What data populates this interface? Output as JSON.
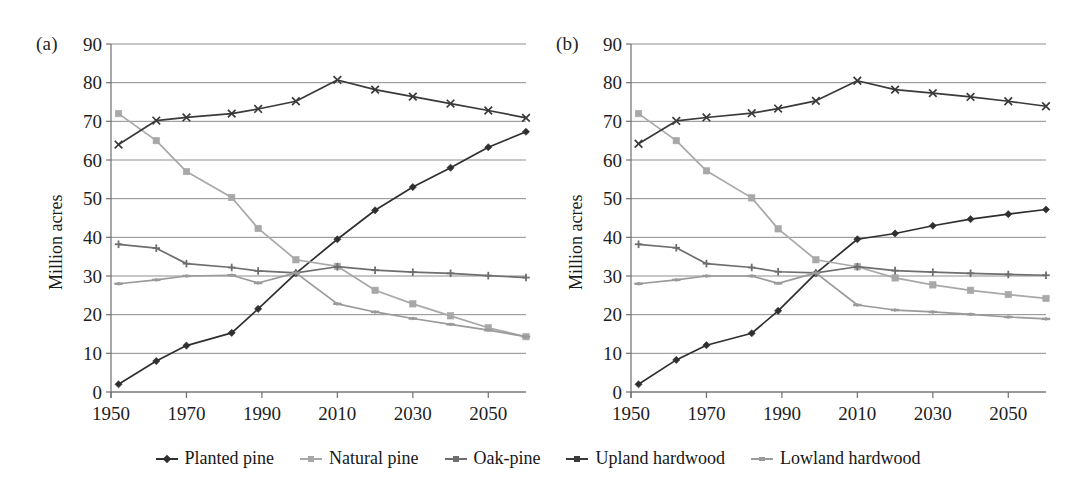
{
  "figure": {
    "background": "#ffffff",
    "panels": [
      {
        "letter": "(a)",
        "ylabel": "Million acres"
      },
      {
        "letter": "(b)",
        "ylabel": "Million acres"
      }
    ]
  },
  "legend": {
    "position": "bottom-center",
    "items": [
      {
        "label": "Planted pine",
        "color": "#2f2f2f",
        "marker": "diamond"
      },
      {
        "label": "Natural pine",
        "color": "#a8a8a8",
        "marker": "square"
      },
      {
        "label": "Oak-pine",
        "color": "#6e6e6e",
        "marker": "plus"
      },
      {
        "label": "Upland hardwood",
        "color": "#3a3a3a",
        "marker": "cross"
      },
      {
        "label": "Lowland hardwood",
        "color": "#9a9a9a",
        "marker": "dash"
      }
    ]
  },
  "chart_data": [
    {
      "type": "line",
      "panel": "(a)",
      "title": "",
      "xlabel": "",
      "ylabel": "Million acres",
      "grid": true,
      "legend_position": "below-figure",
      "x": [
        1952,
        1962,
        1970,
        1982,
        1989,
        1999,
        2010,
        2020,
        2030,
        2040,
        2050,
        2060
      ],
      "xlim": [
        1950,
        2060
      ],
      "ylim": [
        0,
        90
      ],
      "xticks": [
        1950,
        1970,
        1990,
        2010,
        2030,
        2050
      ],
      "xticklabels": [
        "1950",
        "1970",
        "1990",
        "2010",
        "2030",
        "2050"
      ],
      "yticks": [
        0,
        10,
        20,
        30,
        40,
        50,
        60,
        70,
        80,
        90
      ],
      "yticklabels": [
        "0",
        "10",
        "20",
        "30",
        "40",
        "50",
        "60",
        "70",
        "80",
        "90"
      ],
      "series": [
        {
          "name": "Planted pine",
          "color": "#2f2f2f",
          "marker": "diamond",
          "values": [
            2,
            8,
            12,
            15.3,
            21.5,
            30.7,
            39.5,
            47,
            53,
            58,
            63.3,
            67.3
          ]
        },
        {
          "name": "Natural pine",
          "color": "#a8a8a8",
          "marker": "square",
          "values": [
            72,
            65,
            57,
            50.3,
            42.3,
            34.2,
            32.5,
            26.3,
            22.8,
            19.7,
            16.6,
            14.3
          ]
        },
        {
          "name": "Oak-pine",
          "color": "#6e6e6e",
          "marker": "plus",
          "values": [
            38.2,
            37.2,
            33.2,
            32.2,
            31.3,
            30.8,
            32.4,
            31.5,
            31,
            30.7,
            30.1,
            29.6
          ]
        },
        {
          "name": "Upland hardwood",
          "color": "#3a3a3a",
          "marker": "cross",
          "values": [
            64,
            70.2,
            71,
            72,
            73.2,
            75.2,
            80.7,
            78.2,
            76.4,
            74.6,
            72.8,
            70.9
          ]
        },
        {
          "name": "Lowland hardwood",
          "color": "#9a9a9a",
          "marker": "dash",
          "values": [
            28,
            29,
            30,
            30.2,
            28.2,
            30.8,
            22.8,
            20.7,
            19,
            17.5,
            16,
            14.3
          ]
        }
      ]
    },
    {
      "type": "line",
      "panel": "(b)",
      "title": "",
      "xlabel": "",
      "ylabel": "Million acres",
      "grid": true,
      "legend_position": "below-figure",
      "x": [
        1952,
        1962,
        1970,
        1982,
        1989,
        1999,
        2010,
        2020,
        2030,
        2040,
        2050,
        2060
      ],
      "xlim": [
        1950,
        2060
      ],
      "ylim": [
        0,
        90
      ],
      "xticks": [
        1950,
        1970,
        1990,
        2010,
        2030,
        2050
      ],
      "xticklabels": [
        "1950",
        "1970",
        "1990",
        "2010",
        "2030",
        "2050"
      ],
      "yticks": [
        0,
        10,
        20,
        30,
        40,
        50,
        60,
        70,
        80,
        90
      ],
      "yticklabels": [
        "0",
        "10",
        "20",
        "30",
        "40",
        "50",
        "60",
        "70",
        "80",
        "90"
      ],
      "series": [
        {
          "name": "Planted pine",
          "color": "#2f2f2f",
          "marker": "diamond",
          "values": [
            2,
            8.3,
            12.1,
            15.2,
            21,
            30.7,
            39.5,
            41,
            43,
            44.7,
            46,
            47.2
          ]
        },
        {
          "name": "Natural pine",
          "color": "#a8a8a8",
          "marker": "square",
          "values": [
            72,
            65,
            57.2,
            50.2,
            42.2,
            34.2,
            32.4,
            29.5,
            27.7,
            26.3,
            25.2,
            24.2
          ]
        },
        {
          "name": "Oak-pine",
          "color": "#6e6e6e",
          "marker": "plus",
          "values": [
            38.2,
            37.3,
            33.2,
            32.2,
            31.1,
            30.8,
            32.4,
            31.4,
            31,
            30.7,
            30.4,
            30.2
          ]
        },
        {
          "name": "Upland hardwood",
          "color": "#3a3a3a",
          "marker": "cross",
          "values": [
            64.2,
            70.1,
            71,
            72.1,
            73.3,
            75.3,
            80.5,
            78.2,
            77.3,
            76.3,
            75.2,
            73.9
          ]
        },
        {
          "name": "Lowland hardwood",
          "color": "#9a9a9a",
          "marker": "dash",
          "values": [
            28,
            29,
            30,
            30,
            28.1,
            30.8,
            22.5,
            21.2,
            20.7,
            20.1,
            19.4,
            18.9
          ]
        }
      ]
    }
  ]
}
